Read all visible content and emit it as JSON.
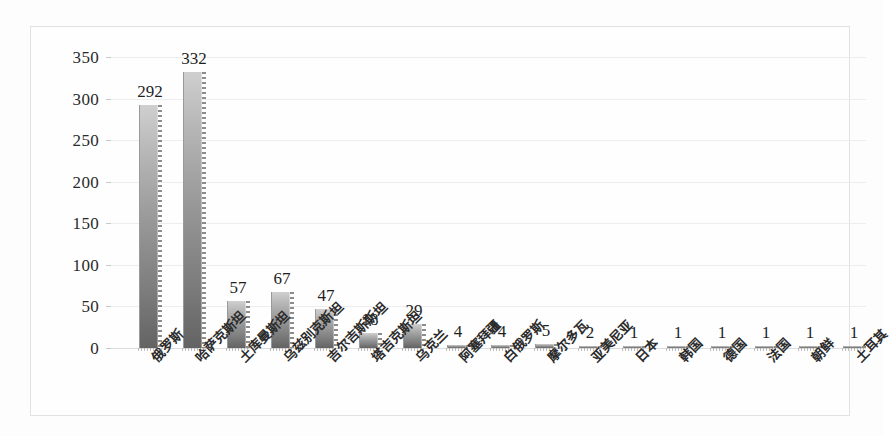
{
  "chart_data": {
    "type": "bar",
    "title": "",
    "subtitle": "",
    "xlabel": "",
    "ylabel": "",
    "ylim": [
      0,
      350
    ],
    "yticks": [
      0,
      50,
      100,
      150,
      200,
      250,
      300,
      350
    ],
    "grid": true,
    "legend": false,
    "legend_position": "none",
    "data_labels": true,
    "categories": [
      "俄罗斯",
      "哈萨克斯坦",
      "土库曼斯坦",
      "乌兹别克斯坦",
      "吉尔吉斯斯坦",
      "塔吉克斯坦",
      "乌克兰",
      "阿塞拜疆",
      "白俄罗斯",
      "摩尔多瓦",
      "亚美尼亚",
      "日本",
      "韩国",
      "德国",
      "法国",
      "朝鲜",
      "土耳其"
    ],
    "values": [
      292,
      332,
      57,
      67,
      47,
      18,
      29,
      4,
      4,
      5,
      2,
      1,
      1,
      1,
      1,
      1,
      1
    ],
    "series": [
      {
        "name": "",
        "values": [
          292,
          332,
          57,
          67,
          47,
          18,
          29,
          4,
          4,
          5,
          2,
          1,
          1,
          1,
          1,
          1,
          1
        ]
      }
    ],
    "colors": {
      "bar_light": "#cfcfcf",
      "bar_dark": "#636363",
      "gridline": "#ededed",
      "axis": "#dcdcdc",
      "text": "#2a2a2a",
      "frame_border": "#e2e2e2",
      "background": "#fefefe"
    }
  }
}
